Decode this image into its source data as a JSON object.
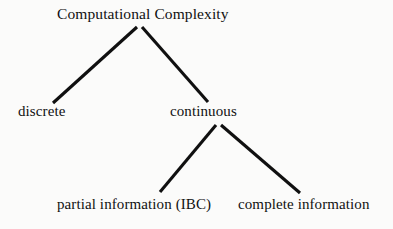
{
  "diagram": {
    "type": "tree",
    "title_text": "Computational Complexity",
    "background_color": "#fbfbfa",
    "line_color": "#101010",
    "text_color": "#111111",
    "nodes": [
      {
        "id": "root",
        "label": "Computational Complexity",
        "level": 0
      },
      {
        "id": "discrete",
        "label": "discrete",
        "level": 1
      },
      {
        "id": "continuous",
        "label": "continuous",
        "level": 1
      },
      {
        "id": "partial",
        "label": "partial information (IBC)",
        "level": 2
      },
      {
        "id": "complete",
        "label": "complete information",
        "level": 2
      }
    ],
    "edges": [
      {
        "from": "root",
        "to": "discrete"
      },
      {
        "from": "root",
        "to": "continuous"
      },
      {
        "from": "continuous",
        "to": "partial"
      },
      {
        "from": "continuous",
        "to": "complete"
      }
    ]
  }
}
